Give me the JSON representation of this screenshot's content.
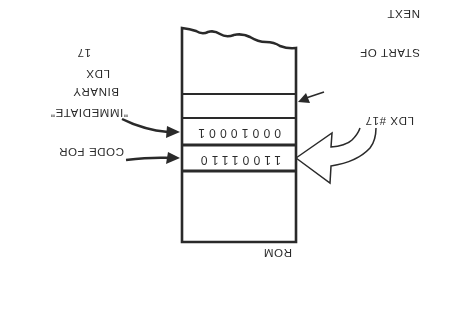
{
  "diagram": {
    "orientation": "rotated-180",
    "memory": {
      "label": "ROM",
      "cells": [
        {
          "role": "opcode",
          "bits": "11001110"
        },
        {
          "role": "operand",
          "bits": "00010001"
        },
        {
          "role": "next-instruction",
          "bits": ""
        }
      ]
    },
    "annotations": {
      "instruction": "LDX #17",
      "opcode_label_line1": "CODE FOR",
      "opcode_label_line2": "\"IMMEDIATE\"",
      "opcode_label_line3": "LDX",
      "operand_label_line1": "BINARY",
      "operand_label_line2": "17",
      "next_label_line1": "START OF",
      "next_label_line2": "NEXT",
      "next_label_line3": "INSTRUCTION"
    },
    "colors": {
      "ink": "#2a2a2a",
      "background": "#ffffff"
    }
  }
}
